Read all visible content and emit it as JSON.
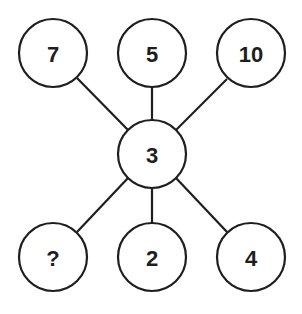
{
  "diagram": {
    "type": "number-puzzle",
    "center": {
      "label": "3",
      "x": 152,
      "y": 154,
      "r": 34
    },
    "top_row": [
      {
        "label": "7",
        "x": 53,
        "y": 53,
        "r": 34
      },
      {
        "label": "5",
        "x": 152,
        "y": 53,
        "r": 34
      },
      {
        "label": "10",
        "x": 251,
        "y": 53,
        "r": 34
      }
    ],
    "bottom_row": [
      {
        "label": "?",
        "x": 53,
        "y": 257,
        "r": 34
      },
      {
        "label": "2",
        "x": 152,
        "y": 257,
        "r": 34
      },
      {
        "label": "4",
        "x": 251,
        "y": 257,
        "r": 34
      }
    ],
    "colors": {
      "stroke": "#1e1e1e",
      "fill": "#ffffff",
      "text": "#1e1e1e"
    }
  }
}
